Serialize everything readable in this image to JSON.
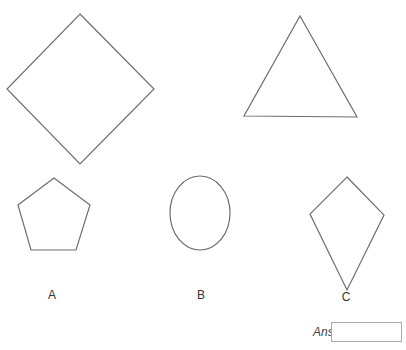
{
  "shapes": [
    {
      "name": "square",
      "type": "polygon",
      "points": "80,14 154,89 80,164 7,89"
    },
    {
      "name": "triangle",
      "type": "polygon",
      "points": "300,16 357,117 244,116"
    },
    {
      "name": "pentagon",
      "type": "polygon",
      "points": "54,178 90,205 76,250 31,250 18,205"
    },
    {
      "name": "circle",
      "type": "ellipse",
      "cx": 200,
      "cy": 213,
      "rx": 30,
      "ry": 37
    },
    {
      "name": "kite",
      "type": "polygon",
      "points": "347,177 384,215 347,290 310,214"
    }
  ],
  "labels": {
    "a": {
      "text": "A",
      "x": 52,
      "y": 299
    },
    "b": {
      "text": "B",
      "x": 201,
      "y": 299
    },
    "c": {
      "text": "C",
      "x": 346,
      "y": 301
    }
  },
  "answer": {
    "label": "Answer",
    "value": ""
  }
}
